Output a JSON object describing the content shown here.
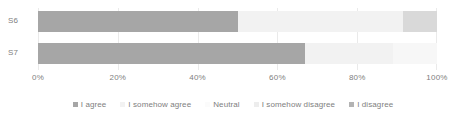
{
  "chart_data": {
    "type": "bar",
    "orientation": "horizontal",
    "stacked": true,
    "stack_mode": "percent",
    "title": "",
    "subtitle": "",
    "xlabel": "",
    "ylabel": "",
    "categories": [
      "S6",
      "S7"
    ],
    "xlim": [
      0,
      100
    ],
    "xticks": [
      0,
      20,
      40,
      60,
      80,
      100
    ],
    "xtick_labels": [
      "0%",
      "20%",
      "40%",
      "60%",
      "80%",
      "100%"
    ],
    "grid": true,
    "legend_position": "bottom",
    "series": [
      {
        "name": "I agree",
        "color": "#a6a6a6",
        "values": [
          50,
          67
        ]
      },
      {
        "name": "I somehow agree",
        "color": "#f2f2f2",
        "values": [
          41.5,
          22
        ]
      },
      {
        "name": "Neutral",
        "color": "#fafafa",
        "values": [
          0,
          0
        ]
      },
      {
        "name": "I somehow disagree",
        "color": "#f7f7f7",
        "values": [
          0,
          11
        ]
      },
      {
        "name": "I disagree",
        "color": "#d9d9d9",
        "values": [
          8.5,
          0
        ]
      }
    ]
  },
  "axis": {
    "tick_0": "0%",
    "tick_1": "20%",
    "tick_2": "40%",
    "tick_3": "60%",
    "tick_4": "80%",
    "tick_5": "100%"
  },
  "labels": {
    "cat_0": "S6",
    "cat_1": "S7"
  },
  "legend": {
    "item_0": "I agree",
    "item_1": "I somehow agree",
    "item_2": "Neutral",
    "item_3": "I somehow disagree",
    "item_4": "I disagree"
  },
  "colors": {
    "agree": "#a6a6a6",
    "somehow_agree": "#f2f2f2",
    "neutral": "#fafafa",
    "somehow_disagree": "#f7f7f7",
    "disagree": "#d9d9d9",
    "gridline": "#eaeaea",
    "text": "#808080",
    "background": "#ffffff"
  }
}
